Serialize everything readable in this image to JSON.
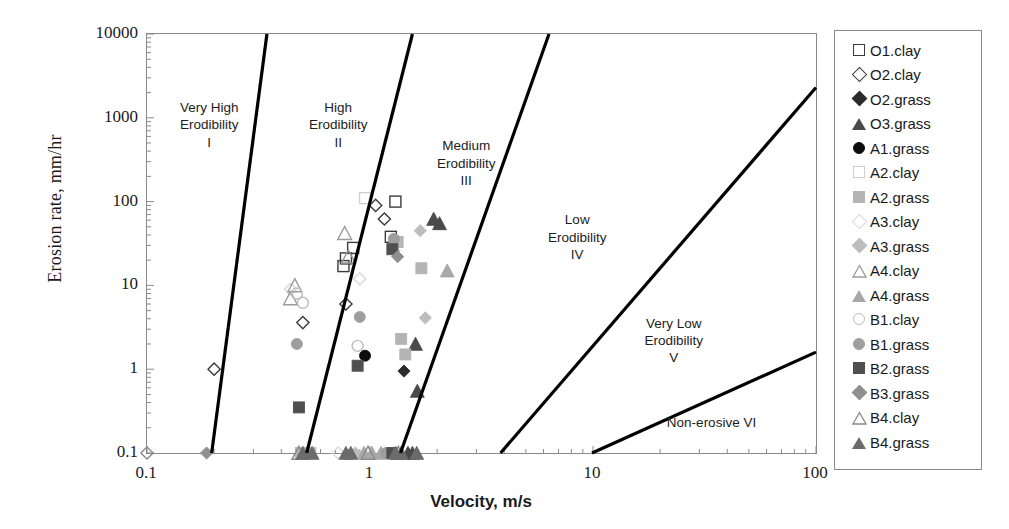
{
  "chart_data": {
    "type": "scatter",
    "title": "",
    "xlabel": "Velocity, m/s",
    "ylabel": "Erosion rate, mm/hr",
    "xscale": "log",
    "yscale": "log",
    "xlim": [
      0.1,
      100
    ],
    "ylim": [
      0.1,
      10000
    ],
    "xticks": [
      "0.1",
      "1",
      "10",
      "100"
    ],
    "yticks": [
      "0.1",
      "1",
      "10",
      "100",
      "1000",
      "10000"
    ],
    "grid": false,
    "legend_position": "right-outside",
    "regions": [
      {
        "id": "I",
        "label": "Very High\nErodibility\nI",
        "x": 0.19,
        "y": 1200
      },
      {
        "id": "II",
        "label": "High\nErodibility\nII",
        "x": 0.72,
        "y": 1200
      },
      {
        "id": "III",
        "label": "Medium\nErodibility\nIII",
        "x": 2.7,
        "y": 420
      },
      {
        "id": "IV",
        "label": "Low\nErodibility\nIV",
        "x": 8.5,
        "y": 55
      },
      {
        "id": "V",
        "label": "Very Low\nErodibility\nV",
        "x": 23,
        "y": 3.2
      },
      {
        "id": "VI",
        "label": "Non-erosive VI",
        "x": 34,
        "y": 0.21
      }
    ],
    "boundary_lines": [
      {
        "name": "I-II",
        "x0": 0.195,
        "y0": 0.1,
        "x1": 0.345,
        "y1": 10000
      },
      {
        "name": "II-III",
        "x0": 0.52,
        "y0": 0.1,
        "x1": 1.55,
        "y1": 10000
      },
      {
        "name": "III-IV",
        "x0": 1.37,
        "y0": 0.1,
        "x1": 6.35,
        "y1": 10000
      },
      {
        "name": "IV-V",
        "x0": 3.85,
        "y0": 0.1,
        "x1": 100.0,
        "y1": 2300
      },
      {
        "name": "V-VI",
        "x0": 9.9,
        "y0": 0.1,
        "x1": 100.0,
        "y1": 1.6
      }
    ],
    "series": [
      {
        "name": "O1.clay",
        "marker": "square",
        "fill": "none",
        "edge": "#3b3b3b",
        "points": [
          [
            1.3,
            100
          ],
          [
            1.24,
            38
          ],
          [
            0.84,
            28
          ],
          [
            0.78,
            21
          ],
          [
            0.76,
            17
          ]
        ]
      },
      {
        "name": "O2.clay",
        "marker": "diamond",
        "fill": "none",
        "edge": "#3b3b3b",
        "points": [
          [
            1.06,
            90
          ],
          [
            1.16,
            62
          ],
          [
            0.5,
            3.6
          ],
          [
            0.2,
            1.0
          ],
          [
            0.78,
            6.0
          ]
        ]
      },
      {
        "name": "O2.grass",
        "marker": "diamond",
        "fill": "#2b2b2b",
        "edge": "#2b2b2b",
        "points": [
          [
            1.42,
            0.95
          ]
        ]
      },
      {
        "name": "O3.grass",
        "marker": "triangle",
        "fill": "#4a4a4a",
        "edge": "#4a4a4a",
        "points": [
          [
            1.93,
            62
          ],
          [
            2.05,
            55
          ],
          [
            1.6,
            2.0
          ],
          [
            1.63,
            0.55
          ],
          [
            1.55,
            0.1
          ],
          [
            1.48,
            0.1
          ]
        ]
      },
      {
        "name": "A1.grass",
        "marker": "circle",
        "fill": "#0d0d0d",
        "edge": "#0d0d0d",
        "points": [
          [
            0.95,
            1.45
          ]
        ]
      },
      {
        "name": "A2.clay",
        "marker": "square",
        "fill": "none",
        "edge": "#cfcfcf",
        "points": [
          [
            0.95,
            110
          ]
        ]
      },
      {
        "name": "A2.grass",
        "marker": "square",
        "fill": "#b4b4b4",
        "edge": "#b4b4b4",
        "points": [
          [
            1.33,
            33
          ],
          [
            1.7,
            16
          ],
          [
            1.38,
            2.3
          ],
          [
            1.44,
            1.5
          ],
          [
            0.49,
            0.1
          ],
          [
            0.54,
            0.1
          ]
        ]
      },
      {
        "name": "A3.clay",
        "marker": "diamond",
        "fill": "none",
        "edge": "#d9d9d9",
        "points": [
          [
            0.9,
            12
          ],
          [
            0.44,
            9.0
          ],
          [
            0.72,
            0.1
          ]
        ]
      },
      {
        "name": "A3.grass",
        "marker": "diamond",
        "fill": "#bdbdbd",
        "edge": "#bdbdbd",
        "points": [
          [
            1.68,
            45
          ],
          [
            1.77,
            4.1
          ],
          [
            1.28,
            26
          ],
          [
            0.86,
            0.1
          ]
        ]
      },
      {
        "name": "A4.clay",
        "marker": "triangle",
        "fill": "none",
        "edge": "#9a9a9a",
        "points": [
          [
            0.77,
            42
          ],
          [
            0.46,
            10.0
          ],
          [
            0.44,
            7.0
          ],
          [
            0.8,
            22
          ]
        ]
      },
      {
        "name": "A4.grass",
        "marker": "triangle",
        "fill": "#a8a8a8",
        "edge": "#a8a8a8",
        "points": [
          [
            2.22,
            15
          ],
          [
            1.02,
            0.1
          ],
          [
            1.12,
            0.1
          ],
          [
            0.94,
            0.1
          ]
        ]
      },
      {
        "name": "B1.clay",
        "marker": "circle",
        "fill": "none",
        "edge": "#bdbdbd",
        "points": [
          [
            1.3,
            33
          ],
          [
            0.47,
            8.0
          ],
          [
            0.88,
            1.9
          ],
          [
            0.5,
            6.2
          ]
        ]
      },
      {
        "name": "B1.grass",
        "marker": "circle",
        "fill": "#9e9e9e",
        "edge": "#9e9e9e",
        "points": [
          [
            0.9,
            4.2
          ],
          [
            0.47,
            2.0
          ],
          [
            1.28,
            36
          ],
          [
            1.18,
            0.1
          ]
        ]
      },
      {
        "name": "B2.grass",
        "marker": "square",
        "fill": "#4f4f4f",
        "edge": "#4f4f4f",
        "points": [
          [
            1.26,
            27
          ],
          [
            0.88,
            1.1
          ],
          [
            0.48,
            0.35
          ],
          [
            1.26,
            0.1
          ]
        ]
      },
      {
        "name": "B3.grass",
        "marker": "diamond",
        "fill": "#8f8f8f",
        "edge": "#8f8f8f",
        "points": [
          [
            1.33,
            22
          ],
          [
            0.185,
            0.1
          ]
        ]
      },
      {
        "name": "B4.clay",
        "marker": "triangle",
        "fill": "none",
        "edge": "#8a8a8a",
        "points": [
          [
            0.48,
            0.1
          ],
          [
            1.34,
            0.1
          ],
          [
            0.98,
            0.1
          ]
        ]
      },
      {
        "name": "B4.grass",
        "marker": "triangle",
        "fill": "#6b6b6b",
        "edge": "#6b6b6b",
        "points": [
          [
            0.5,
            0.1
          ],
          [
            0.55,
            0.1
          ],
          [
            0.78,
            0.1
          ],
          [
            0.82,
            0.1
          ],
          [
            1.3,
            0.1
          ],
          [
            1.38,
            0.1
          ],
          [
            1.62,
            0.1
          ]
        ]
      }
    ],
    "origin_marker": {
      "marker": "diamond",
      "fill": "none",
      "edge": "#8a8a8a",
      "point": [
        0.1,
        0.1
      ]
    }
  },
  "legend": {
    "items": [
      {
        "label": "O1.clay",
        "marker": "square",
        "fill": "none",
        "edge": "#3b3b3b"
      },
      {
        "label": "O2.clay",
        "marker": "diamond",
        "fill": "none",
        "edge": "#3b3b3b"
      },
      {
        "label": "O2.grass",
        "marker": "diamond",
        "fill": "#2b2b2b",
        "edge": "#2b2b2b"
      },
      {
        "label": "O3.grass",
        "marker": "triangle",
        "fill": "#4a4a4a",
        "edge": "#4a4a4a"
      },
      {
        "label": "A1.grass",
        "marker": "circle",
        "fill": "#0d0d0d",
        "edge": "#0d0d0d"
      },
      {
        "label": "A2.clay",
        "marker": "square",
        "fill": "none",
        "edge": "#cfcfcf"
      },
      {
        "label": "A2.grass",
        "marker": "square",
        "fill": "#b4b4b4",
        "edge": "#b4b4b4"
      },
      {
        "label": "A3.clay",
        "marker": "diamond",
        "fill": "none",
        "edge": "#d9d9d9"
      },
      {
        "label": "A3.grass",
        "marker": "diamond",
        "fill": "#bdbdbd",
        "edge": "#bdbdbd"
      },
      {
        "label": "A4.clay",
        "marker": "triangle",
        "fill": "none",
        "edge": "#9a9a9a"
      },
      {
        "label": "A4.grass",
        "marker": "triangle",
        "fill": "#a8a8a8",
        "edge": "#a8a8a8"
      },
      {
        "label": "B1.clay",
        "marker": "circle",
        "fill": "none",
        "edge": "#bdbdbd"
      },
      {
        "label": "B1.grass",
        "marker": "circle",
        "fill": "#9e9e9e",
        "edge": "#9e9e9e"
      },
      {
        "label": "B2.grass",
        "marker": "square",
        "fill": "#4f4f4f",
        "edge": "#4f4f4f"
      },
      {
        "label": "B3.grass",
        "marker": "diamond",
        "fill": "#8f8f8f",
        "edge": "#8f8f8f"
      },
      {
        "label": "B4.clay",
        "marker": "triangle",
        "fill": "none",
        "edge": "#8a8a8a"
      },
      {
        "label": "B4.grass",
        "marker": "triangle",
        "fill": "#6b6b6b",
        "edge": "#6b6b6b"
      }
    ]
  },
  "colors": {
    "frame": "#8a8a8a",
    "boundary": "#000000",
    "text": "#1a1a1a"
  }
}
